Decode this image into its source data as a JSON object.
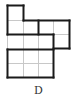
{
  "figure": {
    "option_label": "D",
    "grid_color": "#c8c8c8",
    "outline_color": "#1a1a1a",
    "thin_lines": [
      [
        7,
        20,
        23,
        20
      ],
      [
        23,
        20,
        23,
        49
      ],
      [
        38,
        34,
        38,
        77
      ],
      [
        53,
        20,
        53,
        34
      ],
      [
        53,
        34,
        69,
        34
      ],
      [
        7,
        34,
        7,
        49
      ],
      [
        23,
        49,
        23,
        77
      ],
      [
        7,
        63,
        53,
        63
      ]
    ],
    "thick_lines": [
      [
        7,
        5,
        23,
        5
      ],
      [
        23,
        5,
        23,
        20
      ],
      [
        23,
        20,
        69,
        20
      ],
      [
        69,
        20,
        69,
        48
      ],
      [
        53,
        48,
        69,
        48
      ],
      [
        7,
        5,
        7,
        34
      ],
      [
        7,
        34,
        53,
        34
      ],
      [
        38,
        20,
        38,
        34
      ],
      [
        53,
        34,
        53,
        77
      ],
      [
        7,
        49,
        53,
        49
      ],
      [
        7,
        49,
        7,
        77
      ],
      [
        7,
        77,
        53,
        77
      ]
    ]
  }
}
